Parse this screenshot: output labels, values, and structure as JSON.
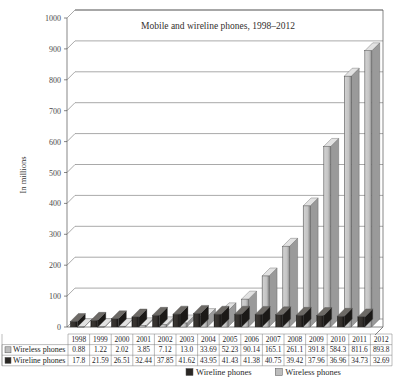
{
  "chart_data": {
    "type": "bar",
    "title": "Mobile and wireline phones, 1998–2012",
    "xlabel": "",
    "ylabel": "In millions",
    "ylim": [
      0,
      1000
    ],
    "yticks": [
      0,
      100,
      200,
      300,
      400,
      500,
      600,
      700,
      800,
      900,
      1000
    ],
    "grid": true,
    "legend_position": "bottom",
    "categories": [
      "1998",
      "1999",
      "2000",
      "2001",
      "2002",
      "2003",
      "2004",
      "2005",
      "2006",
      "2007",
      "2008",
      "2009",
      "2010",
      "2011",
      "2012"
    ],
    "series": [
      {
        "name": "Wireline phones",
        "color": "#2a2724",
        "values": [
          17.8,
          21.59,
          26.51,
          32.44,
          37.85,
          41.62,
          43.95,
          41.43,
          41.38,
          40.75,
          39.42,
          37.96,
          36.96,
          34.73,
          32.69
        ],
        "value_labels": [
          "17.8",
          "21.59",
          "26.51",
          "32.44",
          "37.85",
          "41.62",
          "43.95",
          "41.43",
          "41.38",
          "40.75",
          "39.42",
          "37.96",
          "36.96",
          "34.73",
          "32.69"
        ]
      },
      {
        "name": "Wireless phones",
        "color": "#bdbdbd",
        "values": [
          0.88,
          1.22,
          2.02,
          3.85,
          7.12,
          13.0,
          33.69,
          52.23,
          90.14,
          165.1,
          261.1,
          391.8,
          584.3,
          811.6,
          893.8
        ],
        "value_labels": [
          "0.88",
          "1.22",
          "2.02",
          "3.85",
          "7.12",
          "13.0",
          "33.69",
          "52.23",
          "90.14",
          "165.1",
          "261.1",
          "391.8",
          "584.3",
          "811.6",
          "893.8"
        ]
      }
    ]
  },
  "legend": {
    "items": [
      {
        "label": "Wireline phones",
        "color": "#2a2724"
      },
      {
        "label": "Wireless phones",
        "color": "#bdbdbd"
      }
    ]
  },
  "data_table": {
    "row_order": [
      "Wireless phones",
      "Wireline phones"
    ],
    "header": [
      "1998",
      "1999",
      "2000",
      "2001",
      "2002",
      "2003",
      "2004",
      "2005",
      "2006",
      "2007",
      "2008",
      "2009",
      "2010",
      "2011",
      "2012"
    ],
    "rows": [
      {
        "label": "Wireless phones",
        "swatch": "#bdbdbd",
        "cells": [
          "0.88",
          "1.22",
          "2.02",
          "3.85",
          "7.12",
          "13.0",
          "33.69",
          "52.23",
          "90.14",
          "165.1",
          "261.1",
          "391.8",
          "584.3",
          "811.6",
          "893.8"
        ]
      },
      {
        "label": "Wireline phones",
        "swatch": "#2a2724",
        "cells": [
          "17.8",
          "21.59",
          "26.51",
          "32.44",
          "37.85",
          "41.62",
          "43.95",
          "41.43",
          "41.38",
          "40.75",
          "39.42",
          "37.96",
          "36.96",
          "34.73",
          "32.69"
        ]
      }
    ]
  }
}
